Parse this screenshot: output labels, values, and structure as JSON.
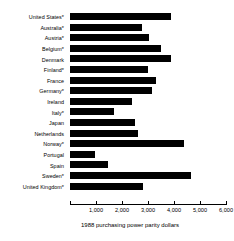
{
  "chart_data": {
    "type": "bar",
    "orientation": "horizontal",
    "title": "",
    "xlabel": "1988 purchasing power parity dollars",
    "ylabel": "",
    "xlim": [
      0,
      6000
    ],
    "grid": false,
    "legend": null,
    "xticks": [
      0,
      1000,
      2000,
      3000,
      4000,
      5000,
      6000
    ],
    "xtick_labels": [
      "",
      "1,000",
      "2,000",
      "3,000",
      "4,000",
      "5,000",
      "6,000"
    ],
    "categories": [
      "United States*",
      "Australia*",
      "Austria*",
      "Belgium*",
      "Denmark",
      "Finland*",
      "France",
      "Germany*",
      "Ireland",
      "Italy*",
      "Japan",
      "Netherlands",
      "Norway*",
      "Portugal",
      "Spain",
      "Sweden*",
      "United Kingdom*"
    ],
    "values": [
      3900,
      2750,
      3050,
      3500,
      3900,
      3000,
      3300,
      3150,
      2400,
      1700,
      2500,
      2600,
      4400,
      950,
      1450,
      4650,
      2800
    ],
    "bar_color": "#000000"
  }
}
